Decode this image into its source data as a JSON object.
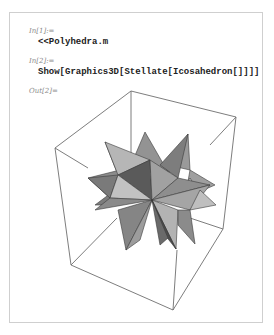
{
  "notebook": {
    "cells": [
      {
        "label": "In[1]:=",
        "code": "<<Polyhedra.m"
      },
      {
        "label": "In[2]:=",
        "code": "Show[Graphics3D[Stellate[Icosahedron[]]]]"
      },
      {
        "label": "Out[2]="
      }
    ],
    "output": {
      "graphic": "stellated-icosahedron-in-bounding-box",
      "colors": {
        "box_edge": "#6e6e6e",
        "face_light": "#bdbdbd",
        "face_mid": "#8f8f8f",
        "face_dark": "#5e5e5e",
        "face_edge": "#3a3a3a"
      }
    }
  }
}
